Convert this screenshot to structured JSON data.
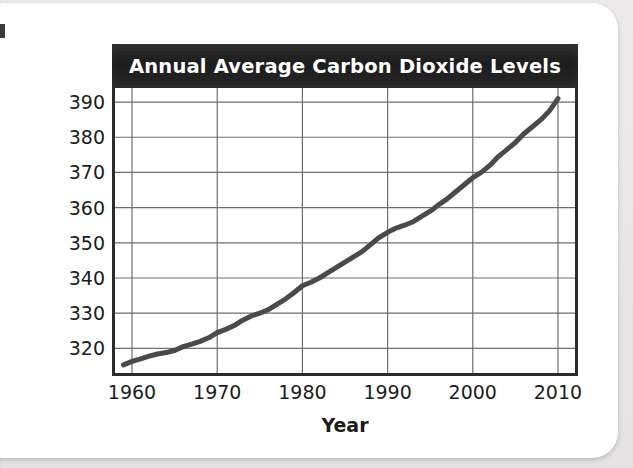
{
  "page": {
    "background_color": "#e9e9e9",
    "card_color": "#ffffff"
  },
  "chart_data": {
    "type": "line",
    "title": "Annual Average Carbon Dioxide Levels",
    "xlabel": "Year",
    "ylabel": "Carbon dioxide (ppm)",
    "xlim": [
      1958,
      2012
    ],
    "ylim": [
      313,
      394
    ],
    "xticks": [
      1960,
      1970,
      1980,
      1990,
      2000,
      2010
    ],
    "yticks": [
      320,
      330,
      340,
      350,
      360,
      370,
      380,
      390
    ],
    "xtick_labels": [
      "1960",
      "1970",
      "1980",
      "1990",
      "2000",
      "2010"
    ],
    "ytick_labels": [
      "320",
      "330",
      "340",
      "350",
      "360",
      "370",
      "380",
      "390"
    ],
    "grid": true,
    "grid_color": "#6e6e6e",
    "legend": null,
    "line_color": "#4a4a4a",
    "line_width": 5,
    "series": [
      {
        "name": "Annual average CO2",
        "x": [
          1959,
          1960,
          1961,
          1962,
          1963,
          1964,
          1965,
          1966,
          1967,
          1968,
          1969,
          1970,
          1971,
          1972,
          1973,
          1974,
          1975,
          1976,
          1977,
          1978,
          1979,
          1980,
          1981,
          1982,
          1983,
          1984,
          1985,
          1986,
          1987,
          1988,
          1989,
          1990,
          1991,
          1992,
          1993,
          1994,
          1995,
          1996,
          1997,
          1998,
          1999,
          2000,
          2001,
          2002,
          2003,
          2004,
          2005,
          2006,
          2007,
          2008,
          2009,
          2010
        ],
        "values": [
          315.3,
          316.3,
          317.0,
          317.8,
          318.4,
          318.8,
          319.4,
          320.5,
          321.2,
          322.0,
          323.0,
          324.5,
          325.4,
          326.5,
          328.0,
          329.2,
          330.0,
          331.0,
          332.5,
          334.0,
          335.8,
          337.8,
          338.8,
          340.0,
          341.5,
          343.0,
          344.5,
          346.0,
          347.5,
          349.5,
          351.5,
          353.0,
          354.2,
          355.0,
          356.0,
          357.5,
          359.0,
          360.8,
          362.5,
          364.5,
          366.5,
          368.5,
          370.0,
          372.0,
          374.5,
          376.5,
          378.5,
          381.0,
          383.0,
          385.0,
          387.5,
          391.0
        ],
        "units": "ppm"
      }
    ]
  }
}
